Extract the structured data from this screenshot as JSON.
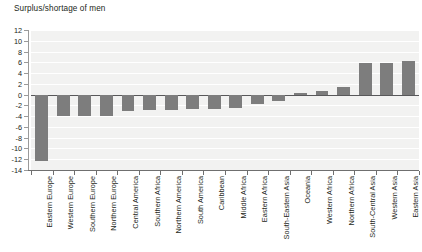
{
  "chart_data": {
    "type": "bar",
    "title": "Surplus/shortage of men",
    "xlabel": "",
    "ylabel": "",
    "ylim": [
      -14,
      12
    ],
    "yticks": [
      12,
      10,
      8,
      6,
      4,
      2,
      0,
      -2,
      -4,
      -6,
      -8,
      -10,
      -12,
      -14
    ],
    "ytick_labels": [
      "12",
      "10",
      "8",
      "6",
      "4",
      "2",
      "0",
      "-2",
      "-4",
      "-6",
      "-8",
      "-10",
      "-12",
      "-14"
    ],
    "grid": true,
    "legend": null,
    "bar_color": "#7d7d7d",
    "plot_background": "#f2f2f1",
    "zero_line_color": "#58585a",
    "categories": [
      "Eastern Europe",
      "Western Europe",
      "Southern Europe",
      "Northern Europe",
      "Central America",
      "Southern Africa",
      "Northern America",
      "South America",
      "Caribbean",
      "Middle Africa",
      "Eastern Africa",
      "South-Eastern Asia",
      "Oceania",
      "Western Africa",
      "Northern Africa",
      "South-Central Asia",
      "Western Asia",
      "Eastern Asia"
    ],
    "values": [
      -12.3,
      -4.0,
      -3.9,
      -3.9,
      -3.0,
      -2.9,
      -2.8,
      -2.7,
      -2.6,
      -2.4,
      -1.7,
      -1.2,
      0.3,
      0.7,
      1.4,
      5.8,
      5.9,
      6.2
    ]
  }
}
